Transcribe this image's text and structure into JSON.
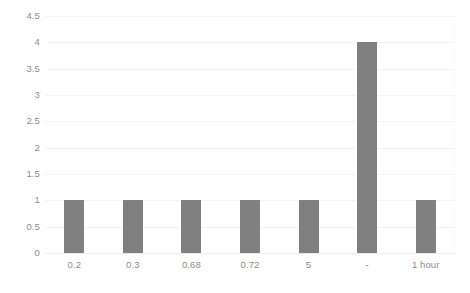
{
  "chart_data": {
    "type": "bar",
    "title": "",
    "subtitle": "",
    "xlabel": "",
    "ylabel": "",
    "categories": [
      "0.2",
      "0.3",
      "0.68",
      "0.72",
      "5",
      "-",
      "1 hour"
    ],
    "values": [
      1,
      1,
      1,
      1,
      1,
      4,
      1
    ],
    "series": [
      {
        "name": "",
        "values": [
          1,
          1,
          1,
          1,
          1,
          4,
          1
        ]
      }
    ],
    "ylim": [
      0,
      4.5
    ],
    "ytick_labels": [
      "0",
      "0.5",
      "1",
      "1.5",
      "2",
      "2.5",
      "3",
      "3.5",
      "4",
      "4.5"
    ],
    "ytick_values": [
      0,
      0.5,
      1,
      1.5,
      2,
      2.5,
      3,
      3.5,
      4,
      4.5
    ],
    "grid": true,
    "grid_axis": "y",
    "legend": false,
    "legend_position": "none",
    "annotations": [],
    "bar_color": "#808080",
    "gridline_color": "#f4f4f4",
    "axis_text_color": "#8c8c8c",
    "background_color": "#ffffff"
  }
}
